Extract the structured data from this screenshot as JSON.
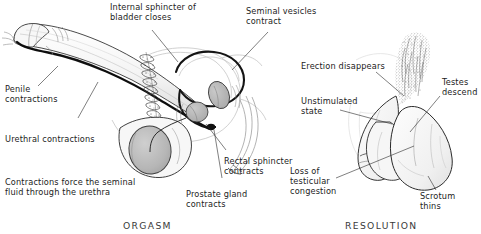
{
  "figure": {
    "kind": "medical-illustration",
    "background_color": "#ffffff",
    "ink_color": "#1c1c1c",
    "fill_gray": "#b9b9b9",
    "light_gray": "#d8d8d8"
  },
  "panels": [
    {
      "id": "orgasm",
      "caption": "ORGASM",
      "view": "sagittal cross-section",
      "labels": [
        {
          "id": "internal-sphincter",
          "text": "Internal sphincter of\nbladder closes"
        },
        {
          "id": "seminal-vesicles",
          "text": "Seminal vesicles\ncontract"
        },
        {
          "id": "penile-contractions",
          "text": "Penile\ncontractions"
        },
        {
          "id": "urethral-contractions",
          "text": "Urethral contractions"
        },
        {
          "id": "seminal-fluid",
          "text": "Contractions force the seminal\nfluid through the urethra"
        },
        {
          "id": "prostate-gland",
          "text": "Prostate gland\ncontracts"
        },
        {
          "id": "rectal-sphincter",
          "text": "Rectal sphincter\ncontracts"
        }
      ]
    },
    {
      "id": "resolution",
      "caption": "RESOLUTION",
      "view": "external view",
      "labels": [
        {
          "id": "erection-disappears",
          "text": "Erection disappears"
        },
        {
          "id": "unstimulated-state",
          "text": "Unstimulated\nstate"
        },
        {
          "id": "testes-descend",
          "text": "Testes\ndescend"
        },
        {
          "id": "loss-of-congestion",
          "text": "Loss of\ntesticular\ncongestion"
        },
        {
          "id": "scrotum-thins",
          "text": "Scrotum\nthins"
        }
      ]
    }
  ]
}
